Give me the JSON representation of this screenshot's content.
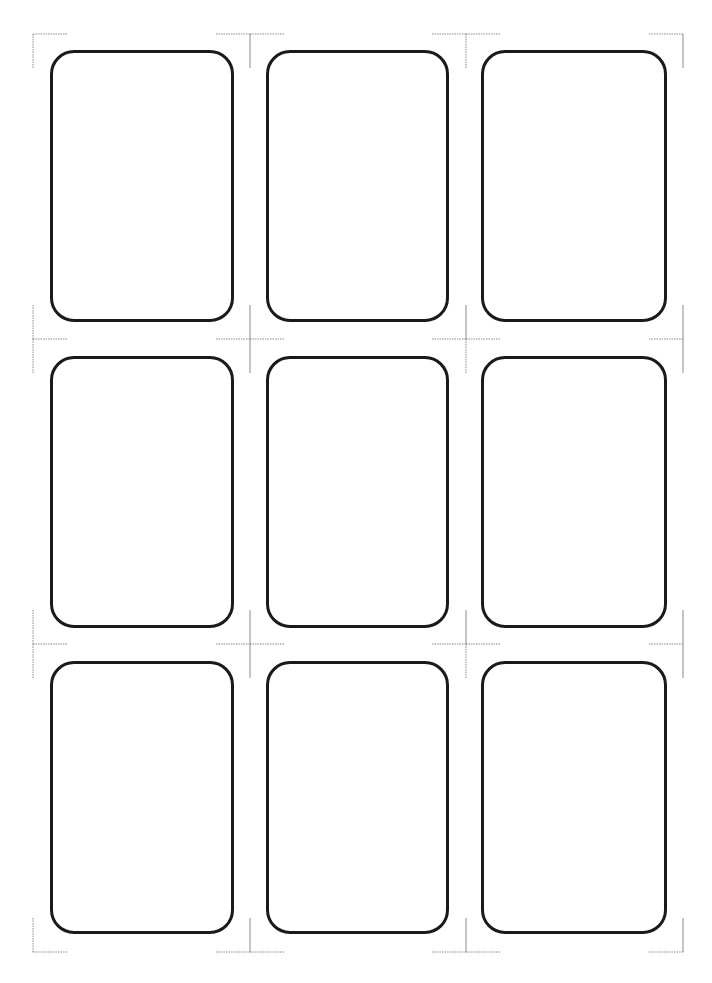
{
  "document": {
    "type": "card-cutting-template",
    "rows": 3,
    "columns": 3,
    "card_count": 9,
    "cards": [
      {
        "row": 1,
        "column": 1
      },
      {
        "row": 1,
        "column": 2
      },
      {
        "row": 1,
        "column": 3
      },
      {
        "row": 2,
        "column": 1
      },
      {
        "row": 2,
        "column": 2
      },
      {
        "row": 2,
        "column": 3
      },
      {
        "row": 3,
        "column": 1
      },
      {
        "row": 3,
        "column": 2
      },
      {
        "row": 3,
        "column": 3
      }
    ]
  },
  "colors": {
    "card_border": "#1a1a1a",
    "crop_mark": "#8a8a8a",
    "background": "#ffffff"
  }
}
